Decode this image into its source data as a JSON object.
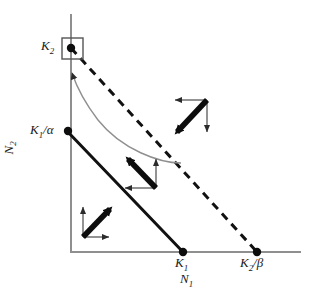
{
  "figure": {
    "background_color": "#ffffff",
    "width": 317,
    "height": 298
  },
  "axes": {
    "x_axis": {
      "name": "N1 axis",
      "label": "N",
      "label_sub": "1",
      "color": "#8c8c8c"
    },
    "y_axis": {
      "name": "N2 axis",
      "label": "N",
      "label_sub": "2",
      "color": "#8c8c8c"
    }
  },
  "labels": {
    "k2": {
      "base": "K",
      "sub": "2"
    },
    "k1_over_alpha": {
      "base": "K",
      "sub": "1",
      "suffix": "/α"
    },
    "k1": {
      "base": "K",
      "sub": "1"
    },
    "k2_over_beta": {
      "base": "K",
      "sub": "2",
      "suffix": "/β"
    },
    "n1_axis": {
      "base": "N",
      "sub": "1"
    },
    "n2_axis": {
      "base": "N",
      "sub": "2"
    }
  },
  "points": [
    {
      "name": "k2-intercept-point",
      "x": 71,
      "y": 48,
      "label": "K2",
      "boxed": true
    },
    {
      "name": "k1-over-alpha-point",
      "x": 67,
      "y": 131,
      "label": "K1/α",
      "boxed": false
    },
    {
      "name": "k1-point",
      "x": 183,
      "y": 252,
      "label": "K1",
      "boxed": false
    },
    {
      "name": "k2-over-beta-point",
      "x": 257,
      "y": 252,
      "label": "K2/β",
      "boxed": false
    }
  ],
  "nullclines": [
    {
      "name": "species-1-nullcline",
      "style": "solid",
      "color": "#111111",
      "from": {
        "x": 67,
        "y": 131
      },
      "to": {
        "x": 183,
        "y": 252
      },
      "from_label": "K1/α",
      "to_label": "K1"
    },
    {
      "name": "species-2-nullcline",
      "style": "dashed",
      "color": "#111111",
      "from": {
        "x": 71,
        "y": 48
      },
      "to": {
        "x": 257,
        "y": 252
      },
      "from_label": "K2",
      "to_label": "K2/β"
    }
  ],
  "vector_clusters": [
    {
      "name": "vector-cluster-lower-left",
      "region": "below both nullclines",
      "corner": {
        "x": 83,
        "y": 237
      },
      "thin_arrows": [
        {
          "name": "n2-component-up",
          "dx": 0,
          "dy": -32,
          "direction": "up"
        },
        {
          "name": "n1-component-right",
          "dx": 28,
          "dy": 0,
          "direction": "right"
        }
      ],
      "resultant": {
        "name": "resultant-up-right",
        "dx": 30,
        "dy": -31,
        "direction": "up-right"
      }
    },
    {
      "name": "vector-cluster-middle",
      "region": "between nullclines",
      "corner": {
        "x": 156,
        "y": 188
      },
      "thin_arrows": [
        {
          "name": "n2-component-up",
          "dx": 0,
          "dy": -32,
          "direction": "up"
        },
        {
          "name": "n1-component-left",
          "dx": -33,
          "dy": 0,
          "direction": "left"
        }
      ],
      "resultant": {
        "name": "resultant-up-left",
        "dx": -31,
        "dy": -32,
        "direction": "up-left"
      }
    },
    {
      "name": "vector-cluster-upper-right",
      "region": "above both nullclines",
      "corner": {
        "x": 207,
        "y": 100
      },
      "thin_arrows": [
        {
          "name": "n1-component-left",
          "dx": -34,
          "dy": 0,
          "direction": "left"
        },
        {
          "name": "n2-component-down",
          "dx": 0,
          "dy": 34,
          "direction": "down"
        }
      ],
      "resultant": {
        "name": "resultant-down-left",
        "dx": -33,
        "dy": 35,
        "direction": "down-left"
      }
    }
  ],
  "trajectory": {
    "name": "curved-trajectory-arrow",
    "description": "thin curved arrow from the interior toward the K2 equilibrium",
    "color": "#8c8c8c",
    "start": {
      "x": 127,
      "y": 158
    },
    "end": {
      "x": 71,
      "y": 70
    },
    "arrowhead_direction": "up"
  },
  "highlight_box": {
    "name": "stable-equilibrium-highlight",
    "x": 62,
    "y": 38,
    "width": 21,
    "height": 21,
    "color": "#555555"
  }
}
